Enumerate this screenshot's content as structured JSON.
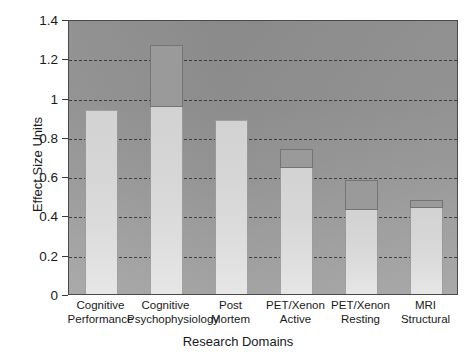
{
  "chart_data": {
    "type": "bar",
    "title": "",
    "xlabel": "Research Domains",
    "ylabel": "Effect Size Units",
    "ylim": [
      0,
      1.4
    ],
    "ytick_values": [
      0,
      0.2,
      0.4,
      0.6,
      0.8,
      1,
      1.2,
      1.4
    ],
    "ytick_labels": [
      "0",
      "0.2",
      "0.4",
      "0.6",
      "0.8",
      "1",
      "1.2",
      "1.4"
    ],
    "grid": "horizontal-dashed",
    "legend": "none",
    "categories": [
      "Cognitive Performance",
      "Cognitive Psychophysiology",
      "Post Mortem",
      "PET/Xenon Active",
      "PET/Xenon Resting",
      "MRI Structural"
    ],
    "category_lines": [
      [
        "Cognitive",
        "Performance"
      ],
      [
        "Cognitive",
        "Psychophysiology"
      ],
      [
        "Post",
        "Mortem"
      ],
      [
        "PET/Xenon",
        "Active"
      ],
      [
        "PET/Xenon",
        "Resting"
      ],
      [
        "MRI",
        "Structural"
      ]
    ],
    "values": [
      0.93,
      1.27,
      0.88,
      0.74,
      0.58,
      0.48
    ],
    "inner_values": [
      0.93,
      0.95,
      0.88,
      0.64,
      0.43,
      0.44
    ],
    "series": [
      {
        "name": "Effect Size",
        "values": [
          0.93,
          1.27,
          0.88,
          0.74,
          0.58,
          0.48
        ]
      }
    ]
  },
  "axes": {
    "y_title": "Effect Size Units",
    "x_title": "Research Domains",
    "y_ticks": [
      {
        "label": "1.4",
        "value": 1.4
      },
      {
        "label": "1.2",
        "value": 1.2
      },
      {
        "label": "1",
        "value": 1
      },
      {
        "label": "0.8",
        "value": 0.8
      },
      {
        "label": "0.6",
        "value": 0.6
      },
      {
        "label": "0.4",
        "value": 0.4
      },
      {
        "label": "0.2",
        "value": 0.2
      },
      {
        "label": "0",
        "value": 0
      }
    ]
  },
  "colors": {
    "background": "#ffffff",
    "plot_background_top": "#8d8d8d",
    "plot_background_bottom": "#a6a6a6",
    "bar_fill": "#d8d8d8",
    "bar_cap": "#9a9a9a",
    "gridline": "#2f2f2f",
    "axis": "#4a4a4a",
    "text": "#1a1a1a"
  }
}
